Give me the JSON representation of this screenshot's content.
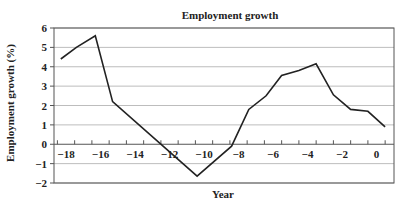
{
  "chart_data": {
    "type": "line",
    "title": "Employment growth",
    "xlabel": "Year",
    "ylabel": "Employment growth (%)",
    "ylim": [
      -2,
      6
    ],
    "xlim": [
      -18.7,
      1.0
    ],
    "yticks": [
      6,
      5,
      4,
      3,
      2,
      1,
      0,
      -1,
      -2
    ],
    "xticks": [
      -18,
      -16,
      -14,
      -12,
      -10,
      -8,
      -6,
      -4,
      -2,
      0
    ],
    "grid": "horizontal",
    "legend": "none",
    "series": [
      {
        "name": "Employment growth",
        "x": [
          -18.3,
          -17.4,
          -16.3,
          -15.3,
          -10.4,
          -8.4,
          -7.4,
          -6.4,
          -5.5,
          -4.5,
          -3.5,
          -2.5,
          -1.5,
          -0.5,
          0.5
        ],
        "values": [
          4.4,
          5.0,
          5.6,
          2.2,
          -1.65,
          -0.1,
          1.8,
          2.5,
          3.55,
          3.8,
          4.15,
          2.55,
          1.8,
          1.7,
          0.9
        ]
      }
    ]
  }
}
